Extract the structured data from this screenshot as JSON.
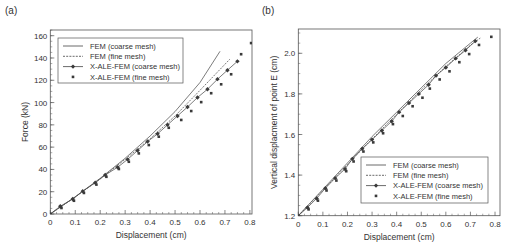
{
  "chart_data": [
    {
      "panel": "(a)",
      "type": "line",
      "title": "",
      "xlabel": "Displacement (cm)",
      "ylabel": "Force (kN)",
      "xlim": [
        0,
        0.82
      ],
      "ylim": [
        0,
        165
      ],
      "xticks": [
        0,
        0.1,
        0.2,
        0.3,
        0.4,
        0.5,
        0.6,
        0.7,
        0.8
      ],
      "xtick_labels": [
        "0",
        "0.1",
        "0.2",
        "0.3",
        "0.4",
        "0.5",
        "0.6",
        "0.7",
        "0.8"
      ],
      "yticks": [
        0,
        20,
        40,
        60,
        80,
        100,
        120,
        140,
        160
      ],
      "ytick_labels": [
        "0",
        "20",
        "40",
        "60",
        "80",
        "100",
        "120",
        "140",
        "160"
      ],
      "grid": false,
      "legend_position": "upper left",
      "legend": [
        "FEM (coarse mesh)",
        "FEM (fine mesh)",
        "X-ALE-FEM (coarse mesh)",
        "X-ALE-FEM (fine mesh)"
      ],
      "series": [
        {
          "name": "FEM (coarse mesh)",
          "style": "solid",
          "x": [
            0,
            0.1,
            0.2,
            0.3,
            0.4,
            0.5,
            0.6,
            0.68
          ],
          "y": [
            0,
            15.5,
            32,
            50,
            70,
            92,
            118,
            146
          ]
        },
        {
          "name": "FEM (fine mesh)",
          "style": "dashed",
          "x": [
            0,
            0.1,
            0.2,
            0.3,
            0.4,
            0.5,
            0.6,
            0.72
          ],
          "y": [
            0,
            15.3,
            31.5,
            49,
            67.5,
            88,
            111,
            139
          ]
        },
        {
          "name": "X-ALE-FEM (coarse mesh)",
          "style": "line-diamond",
          "x": [
            0,
            0.04,
            0.09,
            0.13,
            0.18,
            0.22,
            0.27,
            0.31,
            0.35,
            0.39,
            0.43,
            0.47,
            0.51,
            0.55,
            0.59,
            0.63,
            0.67,
            0.71,
            0.75
          ],
          "y": [
            0,
            7,
            13.5,
            20.5,
            28,
            35,
            42,
            49,
            57,
            65,
            72,
            80,
            88,
            96,
            104.5,
            112,
            121,
            129,
            137
          ]
        },
        {
          "name": "X-ALE-FEM (fine mesh)",
          "style": "square",
          "x": [
            0,
            0.04,
            0.09,
            0.13,
            0.18,
            0.22,
            0.27,
            0.31,
            0.35,
            0.39,
            0.43,
            0.47,
            0.52,
            0.56,
            0.6,
            0.64,
            0.68,
            0.72,
            0.76,
            0.8
          ],
          "y": [
            0,
            7,
            13.5,
            20.5,
            28,
            35,
            42,
            48.5,
            56,
            63.5,
            71,
            79,
            86,
            94,
            102,
            110,
            118,
            127,
            145,
            155
          ]
        }
      ]
    },
    {
      "panel": "(b)",
      "type": "line",
      "title": "",
      "xlabel": "Displacement (cm)",
      "ylabel": "Vertical displacment of point E (cm)",
      "xlim": [
        0,
        0.82
      ],
      "ylim": [
        1.2,
        2.13
      ],
      "xticks": [
        0,
        0.1,
        0.2,
        0.3,
        0.4,
        0.5,
        0.6,
        0.7,
        0.8
      ],
      "xtick_labels": [
        "0",
        "0.1",
        "0.2",
        "0.3",
        "0.4",
        "0.5",
        "0.6",
        "0.7",
        "0.8"
      ],
      "yticks": [
        1.2,
        1.4,
        1.6,
        1.8,
        2.0
      ],
      "ytick_labels": [
        "1.2",
        "1.4",
        "1.6",
        "1.8",
        "2.0"
      ],
      "grid": false,
      "legend_position": "lower right",
      "legend": [
        "FEM (coarse mesh)",
        "FEM (fine mesh)",
        "X-ALE-FEM (coarse mesh)",
        "X-ALE-FEM (fine mesh)"
      ],
      "series": [
        {
          "name": "FEM (coarse mesh)",
          "style": "solid",
          "x": [
            0,
            0.1,
            0.2,
            0.3,
            0.4,
            0.5,
            0.6,
            0.7,
            0.73
          ],
          "y": [
            1.2,
            1.33,
            1.46,
            1.59,
            1.71,
            1.83,
            1.95,
            2.05,
            2.08
          ]
        },
        {
          "name": "FEM (fine mesh)",
          "style": "dashed",
          "x": [
            0,
            0.1,
            0.2,
            0.3,
            0.4,
            0.5,
            0.6,
            0.7,
            0.74
          ],
          "y": [
            1.2,
            1.325,
            1.452,
            1.578,
            1.7,
            1.82,
            1.935,
            2.04,
            2.075
          ]
        },
        {
          "name": "X-ALE-FEM (coarse mesh)",
          "style": "line-diamond",
          "x": [
            0,
            0.037,
            0.075,
            0.11,
            0.15,
            0.19,
            0.22,
            0.26,
            0.3,
            0.34,
            0.38,
            0.41,
            0.45,
            0.49,
            0.53,
            0.56,
            0.6,
            0.64,
            0.68,
            0.72
          ],
          "y": [
            1.2,
            1.24,
            1.285,
            1.335,
            1.385,
            1.43,
            1.48,
            1.53,
            1.575,
            1.62,
            1.665,
            1.71,
            1.755,
            1.8,
            1.845,
            1.89,
            1.93,
            1.975,
            2.015,
            2.06
          ]
        },
        {
          "name": "X-ALE-FEM (fine mesh)",
          "style": "square",
          "x": [
            0,
            0.037,
            0.075,
            0.11,
            0.15,
            0.19,
            0.22,
            0.26,
            0.3,
            0.34,
            0.38,
            0.42,
            0.46,
            0.5,
            0.53,
            0.57,
            0.61,
            0.65,
            0.69,
            0.73,
            0.78
          ],
          "y": [
            1.2,
            1.24,
            1.283,
            1.333,
            1.382,
            1.428,
            1.476,
            1.525,
            1.57,
            1.615,
            1.66,
            1.7,
            1.748,
            1.79,
            1.835,
            1.88,
            1.92,
            1.965,
            2.005,
            2.05,
            2.09
          ]
        }
      ]
    }
  ],
  "colors": {
    "axis": "#555555",
    "series": "#444444",
    "marker": "#3a3a3a",
    "text": "#333333"
  },
  "layout": [
    {
      "frame": {
        "x0": 50.3,
        "x1": 252,
        "y0": 214,
        "y1": 30
      },
      "xpx_per_unit": 249.5,
      "label_pos": [
        5,
        14
      ],
      "legend_box": {
        "x": 58,
        "y": 38,
        "w": 125,
        "h": 45
      }
    },
    {
      "frame": {
        "x0": 298.3,
        "x1": 500,
        "y0": 215.7,
        "y1": 29
      },
      "xpx_per_unit": 245.9,
      "label_pos": [
        262,
        14
      ],
      "legend_box": {
        "x": 361,
        "y": 157,
        "w": 127,
        "h": 46
      }
    }
  ]
}
